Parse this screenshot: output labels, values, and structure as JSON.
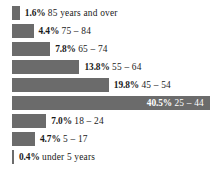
{
  "chart_data": {
    "type": "bar",
    "orientation": "horizontal",
    "title": "",
    "xlabel": "",
    "ylabel": "",
    "grid": false,
    "legend": null,
    "axis_visible": false,
    "value_unit": "%",
    "xlim": [
      0,
      40.5
    ],
    "bar_color": "#6b6b6b",
    "background_color": "#ffffff",
    "label_color": "#1a1a1a",
    "inside_label_color": "#ffffff",
    "categories": [
      "85 years and over",
      "75 – 84",
      "65 – 74",
      "55 – 64",
      "45 – 54",
      "25 – 44",
      "18 – 24",
      "5 – 17",
      "under 5 years"
    ],
    "values": [
      1.6,
      4.4,
      7.8,
      13.8,
      19.8,
      40.5,
      7.0,
      4.7,
      0.4
    ],
    "value_labels": [
      "1.6%",
      "4.4%",
      "7.8%",
      "13.8%",
      "19.8%",
      "40.5%",
      "7.0%",
      "4.7%",
      "0.4%"
    ],
    "bars": [
      {
        "percent_label": "1.6%",
        "category_label": "85 years and over",
        "value": 1.6,
        "label_position": "right"
      },
      {
        "percent_label": "4.4%",
        "category_label": "75 – 84",
        "value": 4.4,
        "label_position": "right"
      },
      {
        "percent_label": "7.8%",
        "category_label": "65 – 74",
        "value": 7.8,
        "label_position": "right"
      },
      {
        "percent_label": "13.8%",
        "category_label": "55 – 64",
        "value": 13.8,
        "label_position": "right"
      },
      {
        "percent_label": "19.8%",
        "category_label": "45 – 54",
        "value": 19.8,
        "label_position": "right"
      },
      {
        "percent_label": "40.5%",
        "category_label": "25 – 44",
        "value": 40.5,
        "label_position": "inside"
      },
      {
        "percent_label": "7.0%",
        "category_label": "18 – 24",
        "value": 7.0,
        "label_position": "right"
      },
      {
        "percent_label": "4.7%",
        "category_label": "5 – 17",
        "value": 4.7,
        "label_position": "right"
      },
      {
        "percent_label": "0.4%",
        "category_label": "under 5 years",
        "value": 0.4,
        "label_position": "right"
      }
    ]
  }
}
